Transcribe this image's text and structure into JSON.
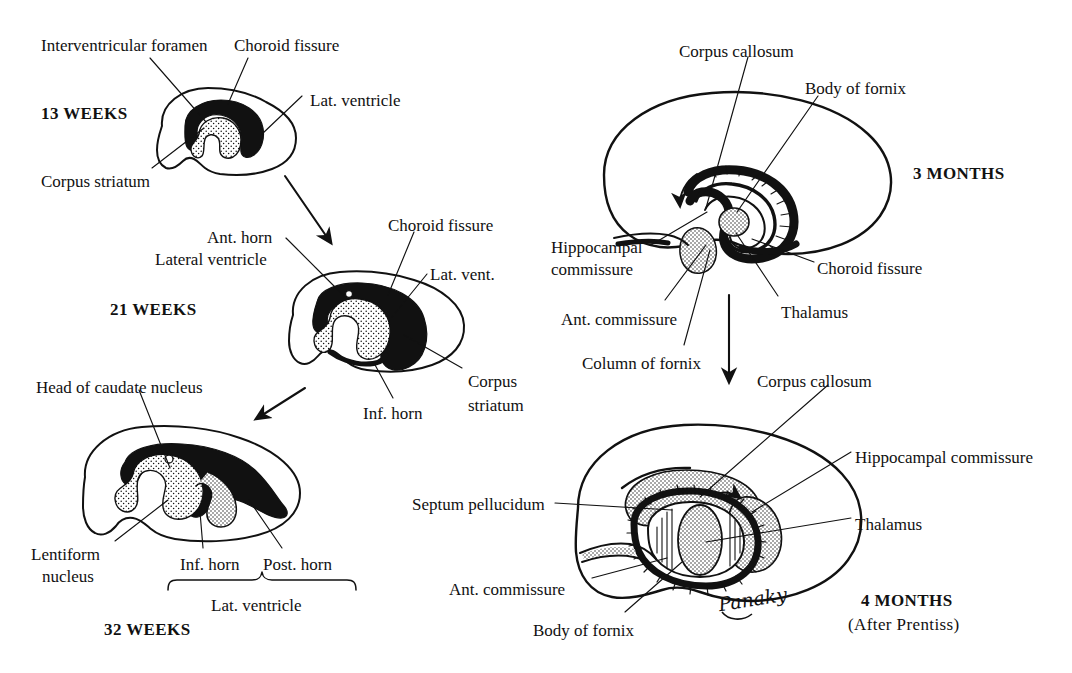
{
  "figure": {
    "attribution": "(After Prentiss)",
    "signature": "Panaky"
  },
  "panels": [
    {
      "id": "13-weeks",
      "stage": "13 WEEKS",
      "labels": [
        {
          "name": "interventricular-foramen",
          "text": "Interventricular foramen",
          "x": 41,
          "y": 36,
          "align": "left"
        },
        {
          "name": "choroid-fissure",
          "text": "Choroid fissure",
          "x": 234,
          "y": 36,
          "align": "left"
        },
        {
          "name": "lat-ventricle",
          "text": "Lat. ventricle",
          "x": 310,
          "y": 91,
          "align": "left"
        },
        {
          "name": "corpus-striatum",
          "text": "Corpus striatum",
          "x": 41,
          "y": 172,
          "align": "left"
        }
      ]
    },
    {
      "id": "21-weeks",
      "stage": "21 WEEKS",
      "labels": [
        {
          "name": "ant-horn",
          "text": "Ant. horn",
          "x": 207,
          "y": 228,
          "align": "left"
        },
        {
          "name": "lateral-ventricle",
          "text": "Lateral ventricle",
          "x": 155,
          "y": 250,
          "align": "left"
        },
        {
          "name": "choroid-fissure",
          "text": "Choroid fissure",
          "x": 388,
          "y": 216,
          "align": "left"
        },
        {
          "name": "lat-vent",
          "text": "Lat. vent.",
          "x": 430,
          "y": 265,
          "align": "left"
        },
        {
          "name": "corpus",
          "text": "Corpus",
          "x": 468,
          "y": 372,
          "align": "left"
        },
        {
          "name": "striatum",
          "text": "striatum",
          "x": 468,
          "y": 396,
          "align": "left"
        },
        {
          "name": "inf-horn",
          "text": "Inf. horn",
          "x": 363,
          "y": 404,
          "align": "left"
        }
      ]
    },
    {
      "id": "32-weeks",
      "stage": "32 WEEKS",
      "labels": [
        {
          "name": "head-of-caudate-nucleus",
          "text": "Head of caudate nucleus",
          "x": 36,
          "y": 378,
          "align": "left"
        },
        {
          "name": "lentiform",
          "text": "Lentiform",
          "x": 31,
          "y": 545,
          "align": "left"
        },
        {
          "name": "nucleus",
          "text": "nucleus",
          "x": 42,
          "y": 567,
          "align": "left"
        },
        {
          "name": "inf-horn",
          "text": "Inf. horn",
          "x": 180,
          "y": 555,
          "align": "left"
        },
        {
          "name": "post-horn",
          "text": "Post. horn",
          "x": 263,
          "y": 555,
          "align": "left"
        },
        {
          "name": "lat-ventricle",
          "text": "Lat. ventricle",
          "x": 211,
          "y": 596,
          "align": "left"
        }
      ]
    },
    {
      "id": "3-months",
      "stage": "3 MONTHS",
      "labels": [
        {
          "name": "corpus-callosum",
          "text": "Corpus callosum",
          "x": 679,
          "y": 42,
          "align": "left"
        },
        {
          "name": "body-of-fornix",
          "text": "Body of fornix",
          "x": 805,
          "y": 79,
          "align": "left"
        },
        {
          "name": "hippocampal",
          "text": "Hippocampal",
          "x": 551,
          "y": 238,
          "align": "left"
        },
        {
          "name": "commissure",
          "text": "commissure",
          "x": 551,
          "y": 260,
          "align": "left"
        },
        {
          "name": "choroid-fissure",
          "text": "Choroid fissure",
          "x": 817,
          "y": 259,
          "align": "left"
        },
        {
          "name": "ant-commissure",
          "text": "Ant. commissure",
          "x": 561,
          "y": 310,
          "align": "left"
        },
        {
          "name": "thalamus",
          "text": "Thalamus",
          "x": 781,
          "y": 303,
          "align": "left"
        },
        {
          "name": "column-of-fornix",
          "text": "Column of fornix",
          "x": 582,
          "y": 354,
          "align": "left"
        }
      ]
    },
    {
      "id": "4-months",
      "stage": "4 MONTHS",
      "substage": "(After Prentiss)",
      "labels": [
        {
          "name": "corpus-callosum",
          "text": "Corpus callosum",
          "x": 757,
          "y": 372,
          "align": "left"
        },
        {
          "name": "hippocampal-commissure",
          "text": "Hippocampal commissure",
          "x": 855,
          "y": 448,
          "align": "left"
        },
        {
          "name": "septum-pellucidum",
          "text": "Septum pellucidum",
          "x": 412,
          "y": 495,
          "align": "left"
        },
        {
          "name": "thalamus",
          "text": "Thalamus",
          "x": 855,
          "y": 515,
          "align": "left"
        },
        {
          "name": "ant-commissure",
          "text": "Ant. commissure",
          "x": 449,
          "y": 580,
          "align": "left"
        },
        {
          "name": "body-of-fornix",
          "text": "Body of fornix",
          "x": 533,
          "y": 621,
          "align": "left"
        }
      ]
    }
  ],
  "stage_positions": [
    {
      "name": "stage-13-weeks",
      "text": "13 WEEKS",
      "x": 41,
      "y": 104
    },
    {
      "name": "stage-21-weeks",
      "text": "21 WEEKS",
      "x": 110,
      "y": 300
    },
    {
      "name": "stage-32-weeks",
      "text": "32 WEEKS",
      "x": 104,
      "y": 620
    },
    {
      "name": "stage-3-months",
      "text": "3 MONTHS",
      "x": 913,
      "y": 164
    },
    {
      "name": "stage-4-months",
      "text": "4 MONTHS",
      "x": 861,
      "y": 591
    },
    {
      "name": "stage-4-months-sub",
      "text": "(After Prentiss)",
      "x": 848,
      "y": 615
    }
  ],
  "colors": {
    "ink": "#111111",
    "paper": "#ffffff",
    "ventricle_fill": "#000000",
    "striatum_fill": "#ffffff"
  }
}
